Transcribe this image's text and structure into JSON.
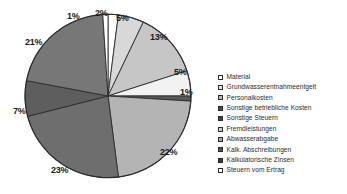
{
  "chart_data": {
    "type": "pie",
    "title": "",
    "subtitle": "",
    "xlabel": "",
    "ylabel": "",
    "grid": false,
    "legend_position": "right",
    "start_angle_deg": 0,
    "direction": "clockwise",
    "categories": [
      "Material",
      "Grundwasserentnahmeentgelt",
      "Personalkosten",
      "Sonstige betriebliche Kosten",
      "Sonstige Steuern",
      "Fremdleistungen",
      "Abwasserabgabe",
      "Kalk. Abschreibungen",
      "Kalkulatorische Zinsen",
      "Steuern vom Ertrag"
    ],
    "values": [
      2,
      5,
      13,
      5,
      1,
      22,
      23,
      7,
      21,
      1
    ],
    "value_labels": [
      "2%",
      "5%",
      "13%",
      "5%",
      "1%",
      "22%",
      "23%",
      "7%",
      "21%",
      "1%"
    ],
    "unit": "%",
    "colors": [
      "#ffffff",
      "#d8d8d8",
      "#c6c6c6",
      "#f2f2f2",
      "#5a5a5a",
      "#b4b4b4",
      "#6e6e6e",
      "#5e5e5e",
      "#777777",
      "#ffffff"
    ],
    "slice_border_color": "#2b2b2b",
    "slices": [
      {
        "label": "Material",
        "value": 2,
        "display": "2%",
        "color": "#ffffff"
      },
      {
        "label": "Grundwasserentnahmeentgelt",
        "value": 5,
        "display": "5%",
        "color": "#d8d8d8"
      },
      {
        "label": "Personalkosten",
        "value": 13,
        "display": "13%",
        "color": "#c6c6c6"
      },
      {
        "label": "Sonstige betriebliche Kosten",
        "value": 5,
        "display": "5%",
        "color": "#f2f2f2"
      },
      {
        "label": "Sonstige Steuern",
        "value": 1,
        "display": "1%",
        "color": "#5a5a5a"
      },
      {
        "label": "Fremdleistungen",
        "value": 22,
        "display": "22%",
        "color": "#b4b4b4"
      },
      {
        "label": "Abwasserabgabe",
        "value": 23,
        "display": "23%",
        "color": "#6e6e6e"
      },
      {
        "label": "Kalk. Abschreibungen",
        "value": 7,
        "display": "7%",
        "color": "#5e5e5e"
      },
      {
        "label": "Kalkulatorische Zinsen",
        "value": 21,
        "display": "21%",
        "color": "#777777"
      },
      {
        "label": "Steuern vom Ertrag",
        "value": 1,
        "display": "1%",
        "color": "#ffffff"
      }
    ],
    "labels_placed": [
      {
        "text": "1%",
        "x": 67,
        "y": 12
      },
      {
        "text": "2%",
        "x": 95,
        "y": 9
      },
      {
        "text": "5%",
        "x": 116,
        "y": 14
      },
      {
        "text": "13%",
        "x": 150,
        "y": 33
      },
      {
        "text": "5%",
        "x": 174,
        "y": 68
      },
      {
        "text": "1%",
        "x": 180,
        "y": 88
      },
      {
        "text": "22%",
        "x": 160,
        "y": 148
      },
      {
        "text": "23%",
        "x": 51,
        "y": 166
      },
      {
        "text": "7%",
        "x": 13,
        "y": 107
      },
      {
        "text": "21%",
        "x": 25,
        "y": 38
      }
    ],
    "geometry": {
      "cx": 108,
      "cy": 96,
      "r": 83
    }
  },
  "legend": {
    "entries": [
      {
        "label": "Material",
        "color": "#ffffff"
      },
      {
        "label": "Grundwasserentnahmeentgelt",
        "color": "#e8e8e8"
      },
      {
        "label": "Personalkosten",
        "color": "#b9b9b9"
      },
      {
        "label": "Sonstige betriebliche Kosten",
        "color": "#4a4a4a"
      },
      {
        "label": "Sonstige Steuern",
        "color": "#444444"
      },
      {
        "label": "Fremdleistungen",
        "color": "#cfcfcf"
      },
      {
        "label": "Abwasserabgabe",
        "color": "#a8a8a8"
      },
      {
        "label": "Kalk. Abschreibungen",
        "color": "#4f4f4f"
      },
      {
        "label": "Kalkulatorische Zinsen",
        "color": "#3d3d3d"
      },
      {
        "label": "Steuern vom Ertrag",
        "color": "#ffffff"
      }
    ]
  }
}
